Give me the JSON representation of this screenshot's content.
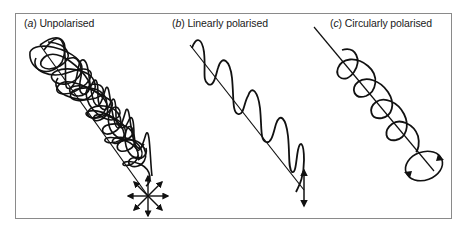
{
  "figure": {
    "panels": [
      {
        "id": "a",
        "letter": "a",
        "title": "Unpolarised"
      },
      {
        "id": "b",
        "letter": "b",
        "title": "Linearly polarised"
      },
      {
        "id": "c",
        "letter": "c",
        "title": "Circularly polarised"
      }
    ],
    "colors": {
      "stroke": "#111111",
      "frame": "#8a8a8a",
      "background": "#ffffff"
    }
  }
}
